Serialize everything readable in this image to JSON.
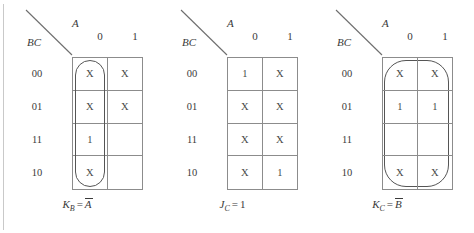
{
  "figure": {
    "type": "karnaugh-maps",
    "count": 3,
    "column_variable": "A",
    "row_variable": "BC",
    "column_labels": [
      "0",
      "1"
    ],
    "row_labels": [
      "00",
      "01",
      "11",
      "10"
    ],
    "colors": {
      "grid_line": "#8c8c8c",
      "loop_line": "#555555",
      "text": "#3a3a3a",
      "background": "#ffffff"
    }
  },
  "maps": [
    {
      "id": "kmap-kb",
      "column_variable": "A",
      "row_variable": "BC",
      "column_labels": [
        "0",
        "1"
      ],
      "row_labels": [
        "00",
        "01",
        "11",
        "10"
      ],
      "cells": [
        [
          "X",
          "X"
        ],
        [
          "X",
          "X"
        ],
        [
          "1",
          ""
        ],
        [
          "X",
          ""
        ]
      ],
      "loop": {
        "shape": "rounded-rectangle",
        "covers": "column A=0, rows 00,01,11,10"
      },
      "caption": {
        "lhs": "K",
        "lhs_sub": "B",
        "eq": "=",
        "rhs": "A",
        "rhs_overbar": true
      }
    },
    {
      "id": "kmap-jc",
      "column_variable": "A",
      "row_variable": "BC",
      "column_labels": [
        "0",
        "1"
      ],
      "row_labels": [
        "00",
        "01",
        "11",
        "10"
      ],
      "cells": [
        [
          "1",
          "X"
        ],
        [
          "X",
          "X"
        ],
        [
          "X",
          "X"
        ],
        [
          "X",
          "1"
        ]
      ],
      "loop": {
        "shape": "rounded-rectangle",
        "covers": "all eight cells"
      },
      "caption": {
        "lhs": "J",
        "lhs_sub": "C",
        "eq": "=",
        "rhs": "1",
        "rhs_overbar": false
      }
    },
    {
      "id": "kmap-kc",
      "column_variable": "A",
      "row_variable": "BC",
      "column_labels": [
        "0",
        "1"
      ],
      "row_labels": [
        "00",
        "01",
        "11",
        "10"
      ],
      "cells": [
        [
          "X",
          "X"
        ],
        [
          "1",
          "1"
        ],
        [
          "",
          ""
        ],
        [
          "X",
          "X"
        ]
      ],
      "loop": {
        "shape": "rounded-rectangle",
        "covers": "rows 00,01 across both columns"
      },
      "caption": {
        "lhs": "K",
        "lhs_sub": "C",
        "eq": "=",
        "rhs": "B",
        "rhs_overbar": true
      }
    }
  ]
}
